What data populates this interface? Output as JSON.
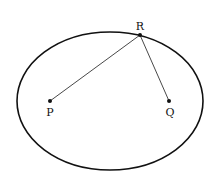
{
  "diagram": {
    "ellipse": {
      "cx": 110,
      "cy": 101,
      "rx": 93,
      "ry": 69,
      "stroke": "#111111",
      "stroke_width": 1.6
    },
    "points": [
      {
        "id": "P",
        "label": "P",
        "x": 50,
        "y": 101,
        "label_x": 50,
        "label_y": 116
      },
      {
        "id": "Q",
        "label": "Q",
        "x": 169,
        "y": 101,
        "label_x": 170,
        "label_y": 116
      },
      {
        "id": "R",
        "label": "R",
        "x": 140,
        "y": 35,
        "label_x": 140,
        "label_y": 30
      }
    ],
    "segments": [
      {
        "from": "R",
        "to": "P"
      },
      {
        "from": "R",
        "to": "Q"
      }
    ],
    "line_color": "#333333"
  }
}
